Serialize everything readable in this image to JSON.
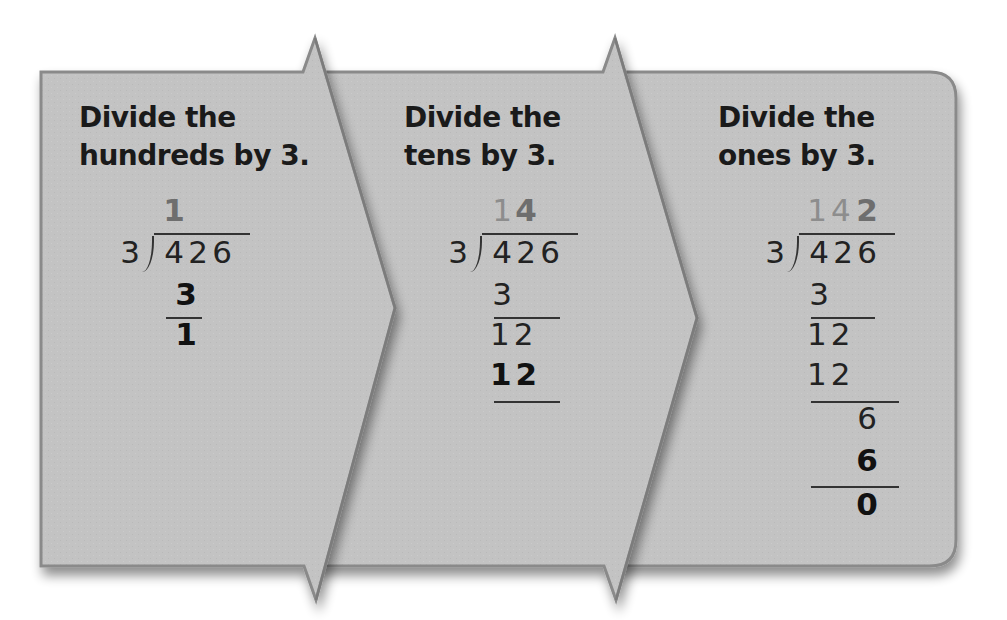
{
  "colors": {
    "panel_fill": "#c2c2c2",
    "panel_border": "#8a8a8a",
    "heading_text": "#1a1a1a",
    "quotient_faded": "#8d8d8d",
    "quotient_new": "#6e6e6e",
    "work_text": "#222222"
  },
  "steps": [
    {
      "heading_line1": "Divide the",
      "heading_line2": "hundreds by 3.",
      "divisor": "3",
      "dividend": [
        "4",
        "2",
        "6"
      ],
      "quotient_faded": "",
      "quotient_new": "1",
      "work": [
        {
          "value": "3",
          "bold": true,
          "underline": true
        },
        {
          "value": "1",
          "bold": true,
          "underline": false
        }
      ]
    },
    {
      "heading_line1": "Divide the",
      "heading_line2": "tens by 3.",
      "divisor": "3",
      "dividend": [
        "4",
        "2",
        "6"
      ],
      "quotient_faded": "1",
      "quotient_new": "4",
      "work": [
        {
          "value": "3",
          "bold": false,
          "underline": true
        },
        {
          "value": "12",
          "bold": false,
          "underline": false
        },
        {
          "value": "12",
          "bold": true,
          "underline": true
        }
      ]
    },
    {
      "heading_line1": "Divide the",
      "heading_line2": "ones by 3.",
      "divisor": "3",
      "dividend": [
        "4",
        "2",
        "6"
      ],
      "quotient_faded": "14",
      "quotient_new": "2",
      "work": [
        {
          "value": "3",
          "bold": false,
          "underline": true
        },
        {
          "value": "12",
          "bold": false,
          "underline": false
        },
        {
          "value": "12",
          "bold": false,
          "underline": true
        },
        {
          "value": "6",
          "bold": false,
          "underline": false
        },
        {
          "value": "6",
          "bold": true,
          "underline": true
        },
        {
          "value": "0",
          "bold": true,
          "underline": false
        }
      ]
    }
  ],
  "flow_arrows": [
    "chevron-1-to-2",
    "chevron-2-to-3"
  ]
}
